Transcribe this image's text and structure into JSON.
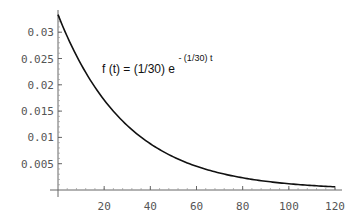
{
  "chart_data": {
    "type": "line",
    "title": "",
    "xlabel": "",
    "ylabel": "",
    "annotation": {
      "main": "f (t) = (1/30) e",
      "superscript": "- (1/30) t"
    },
    "function": "f(t) = (1/30) * exp(-(1/30) * t)",
    "xlim": [
      0,
      120
    ],
    "ylim": [
      0,
      0.0333
    ],
    "grid": false,
    "legend": null,
    "x_ticks": [
      20,
      40,
      60,
      80,
      100,
      120
    ],
    "x_tick_labels": [
      "20",
      "40",
      "60",
      "80",
      "100",
      "120"
    ],
    "y_ticks": [
      0.005,
      0.01,
      0.015,
      0.02,
      0.025,
      0.03
    ],
    "y_tick_labels": [
      "0.005",
      "0.01",
      "0.015",
      "0.02",
      "0.025",
      "0.03"
    ],
    "series": [
      {
        "name": "f(t)",
        "color": "#111111",
        "x": [
          0,
          10,
          20,
          30,
          40,
          50,
          60,
          70,
          80,
          90,
          100,
          110,
          120
        ],
        "values": [
          0.0333,
          0.0239,
          0.0171,
          0.0123,
          0.0088,
          0.0063,
          0.0045,
          0.0032,
          0.0023,
          0.0017,
          0.0012,
          0.0009,
          0.0006
        ]
      }
    ]
  }
}
